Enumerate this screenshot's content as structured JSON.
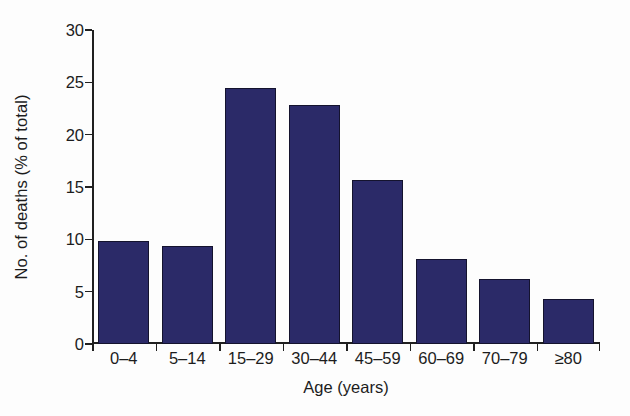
{
  "chart_data": {
    "type": "bar",
    "title": "",
    "subtitle": "",
    "xlabel": "Age (years)",
    "ylabel": "No. of deaths (% of total)",
    "categories": [
      "0–4",
      "5–14",
      "15–29",
      "30–44",
      "45–59",
      "60–69",
      "70–79",
      "≥80"
    ],
    "values": [
      9.8,
      9.4,
      24.5,
      22.8,
      15.7,
      8.1,
      6.2,
      4.3
    ],
    "ylim": [
      0,
      30
    ],
    "yticks": [
      0,
      5,
      10,
      15,
      20,
      25,
      30
    ],
    "ytick_labels": [
      "0",
      "5",
      "10",
      "15",
      "20",
      "25",
      "30"
    ],
    "grid": false,
    "legend": null,
    "legend_position": "none",
    "bar_color": "#2b2a68",
    "bar_edge_color": "#14132e",
    "axis_color": "#202020",
    "background_color": "#fdfdfd",
    "annotations": []
  }
}
